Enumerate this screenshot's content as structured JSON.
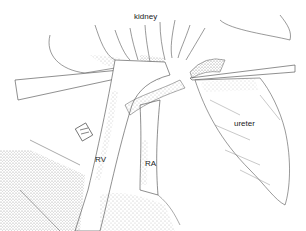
{
  "figure": {
    "type": "anatomical-illustration",
    "style": "pen-and-ink stipple",
    "labels": {
      "kidney": "kidney",
      "ureter": "ureter",
      "renal_vein": "RV",
      "renal_artery": "RA"
    }
  },
  "colors": {
    "background": "#ffffff",
    "ink": "#333333",
    "stipple": "#777777"
  }
}
